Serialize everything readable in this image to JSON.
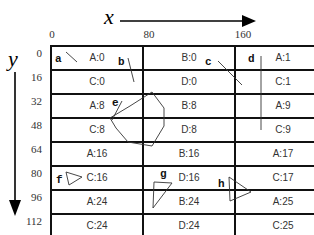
{
  "axes": {
    "x_label": "x",
    "y_label": "y",
    "x_ticks": [
      "0",
      "80",
      "160"
    ],
    "y_ticks": [
      "0",
      "16",
      "32",
      "48",
      "64",
      "80",
      "96",
      "112"
    ]
  },
  "grid": {
    "columns": [
      0,
      80,
      160
    ],
    "rows": [
      {
        "y": 0,
        "cells": [
          "A:0",
          "B:0",
          "A:1"
        ]
      },
      {
        "y": 16,
        "cells": [
          "C:0",
          "D:0",
          "C:1"
        ]
      },
      {
        "y": 32,
        "cells": [
          "A:8",
          "B:8",
          "A:9"
        ]
      },
      {
        "y": 48,
        "cells": [
          "C:8",
          "D:8",
          "C:9"
        ]
      },
      {
        "y": 64,
        "cells": [
          "A:16",
          "B:16",
          "A:17"
        ]
      },
      {
        "y": 80,
        "cells": [
          "C:16",
          "D:16",
          "C:17"
        ]
      },
      {
        "y": 96,
        "cells": [
          "A:24",
          "B:24",
          "A:25"
        ]
      },
      {
        "y": 112,
        "cells": [
          "C:24",
          "D:24",
          "C:25"
        ]
      }
    ]
  },
  "objects": [
    {
      "id": "a",
      "label": "a",
      "shape": "line"
    },
    {
      "id": "b",
      "label": "b",
      "shape": "line"
    },
    {
      "id": "c",
      "label": "c",
      "shape": "line"
    },
    {
      "id": "d",
      "label": "d",
      "shape": "line"
    },
    {
      "id": "e",
      "label": "e",
      "shape": "polygon"
    },
    {
      "id": "f",
      "label": "f",
      "shape": "triangle"
    },
    {
      "id": "g",
      "label": "g",
      "shape": "triangle"
    },
    {
      "id": "h",
      "label": "h",
      "shape": "triangle"
    }
  ],
  "colors": {
    "line": "#000000",
    "shape": "#333333",
    "background": "#ffffff"
  }
}
